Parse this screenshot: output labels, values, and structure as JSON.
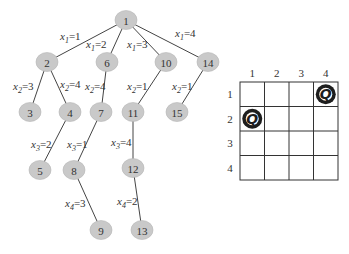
{
  "tree": {
    "nodes": [
      {
        "id": "1",
        "x": 126,
        "y": 20
      },
      {
        "id": "2",
        "x": 47,
        "y": 62
      },
      {
        "id": "6",
        "x": 107,
        "y": 62
      },
      {
        "id": "10",
        "x": 166,
        "y": 62
      },
      {
        "id": "14",
        "x": 208,
        "y": 62
      },
      {
        "id": "3",
        "x": 30,
        "y": 112
      },
      {
        "id": "4",
        "x": 70,
        "y": 112
      },
      {
        "id": "7",
        "x": 101,
        "y": 112
      },
      {
        "id": "11",
        "x": 133,
        "y": 112
      },
      {
        "id": "15",
        "x": 177,
        "y": 112
      },
      {
        "id": "5",
        "x": 40,
        "y": 170
      },
      {
        "id": "8",
        "x": 74,
        "y": 170
      },
      {
        "id": "12",
        "x": 133,
        "y": 168
      },
      {
        "id": "9",
        "x": 101,
        "y": 230
      },
      {
        "id": "13",
        "x": 142,
        "y": 230
      }
    ],
    "edges": [
      {
        "from": "1",
        "to": "2",
        "var": "x",
        "sub": "1",
        "val": "=1",
        "lx": 60,
        "ly": 40
      },
      {
        "from": "1",
        "to": "6",
        "var": "x",
        "sub": "1",
        "val": "=2",
        "lx": 86,
        "ly": 48
      },
      {
        "from": "1",
        "to": "10",
        "var": "x",
        "sub": "1",
        "val": "=3",
        "lx": 127,
        "ly": 48
      },
      {
        "from": "1",
        "to": "14",
        "var": "x",
        "sub": "1",
        "val": "=4",
        "lx": 175,
        "ly": 37
      },
      {
        "from": "2",
        "to": "3",
        "var": "x",
        "sub": "2",
        "val": "=3",
        "lx": 13,
        "ly": 90
      },
      {
        "from": "2",
        "to": "4",
        "var": "x",
        "sub": "2",
        "val": "=4",
        "lx": 60,
        "ly": 88
      },
      {
        "from": "6",
        "to": "7",
        "var": "x",
        "sub": "2",
        "val": "=4",
        "lx": 85,
        "ly": 90
      },
      {
        "from": "10",
        "to": "11",
        "var": "x",
        "sub": "2",
        "val": "=1",
        "lx": 127,
        "ly": 90
      },
      {
        "from": "14",
        "to": "15",
        "var": "x",
        "sub": "2",
        "val": "=1",
        "lx": 172,
        "ly": 90
      },
      {
        "from": "4",
        "to": "5",
        "var": "x",
        "sub": "3",
        "val": "=2",
        "lx": 31,
        "ly": 148
      },
      {
        "from": "7",
        "to": "8",
        "var": "x",
        "sub": "3",
        "val": "=1",
        "lx": 67,
        "ly": 148
      },
      {
        "from": "11",
        "to": "12",
        "var": "x",
        "sub": "3",
        "val": "=4",
        "lx": 111,
        "ly": 146
      },
      {
        "from": "8",
        "to": "9",
        "var": "x",
        "sub": "4",
        "val": "=3",
        "lx": 65,
        "ly": 207
      },
      {
        "from": "12",
        "to": "13",
        "var": "x",
        "sub": "4",
        "val": "=2",
        "lx": 117,
        "ly": 205
      }
    ]
  },
  "board": {
    "size": 4,
    "col_labels": [
      "1",
      "2",
      "3",
      "4"
    ],
    "row_labels": [
      "1",
      "2",
      "3",
      "4"
    ],
    "queens": [
      {
        "row": 1,
        "col": 4,
        "symbol": "Q"
      },
      {
        "row": 2,
        "col": 1,
        "symbol": "Q"
      }
    ]
  }
}
